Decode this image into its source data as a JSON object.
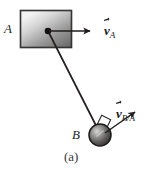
{
  "figure": {
    "caption": "(a)",
    "background_color": "#ffffff",
    "line_color": "#231f1f",
    "width": 158,
    "height": 171
  },
  "bodies": {
    "block": {
      "label": "A",
      "name": "block-a",
      "shape": "rectangle",
      "x": 20,
      "y": 10,
      "width": 52,
      "height": 38,
      "fill_light": "#e8e8e8",
      "fill_dark": "#6e6e6e",
      "border_color": "#2b2828"
    },
    "ball": {
      "label": "B",
      "name": "ball-b",
      "shape": "circle",
      "cx": 100,
      "cy": 135,
      "r": 11,
      "fill_light": "#c9c9c9",
      "fill_dark": "#383535",
      "border_color": "#1c1a1a"
    },
    "pivot": {
      "name": "pivot-dot",
      "cx": 48,
      "cy": 31,
      "r": 3.2,
      "color": "#141212"
    },
    "rod": {
      "name": "connecting-rod",
      "x1": 48,
      "y1": 31,
      "x2": 97,
      "y2": 128,
      "color": "#231f1f"
    },
    "right_angle_marker": {
      "name": "right-angle-marker",
      "cx": 104,
      "cy": 122,
      "size": 9
    }
  },
  "vectors": [
    {
      "id": "v_a",
      "name": "velocity-vector-a",
      "symbol": "v",
      "subscript": "A",
      "x1": 49,
      "y1": 31,
      "x2": 92,
      "y2": 31,
      "color": "#201d1d"
    },
    {
      "id": "v_b_over_a",
      "name": "relative-velocity-vector-b-a",
      "symbol": "v",
      "subscript": "B/A",
      "x1": 104,
      "y1": 133,
      "x2": 137,
      "y2": 111,
      "color": "#201d1d"
    }
  ]
}
